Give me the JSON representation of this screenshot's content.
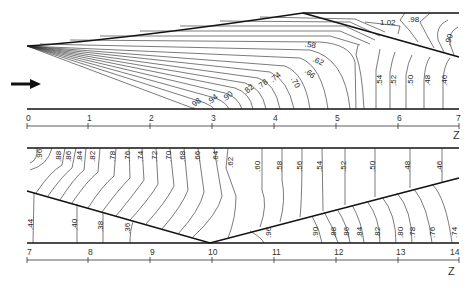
{
  "top_panel": {
    "axis_ticks": [
      "0",
      "1",
      "2",
      "3",
      "4",
      "5",
      "6",
      "7"
    ],
    "axis_label": "Z",
    "contour_labels": [
      ".98",
      ".94",
      ".90",
      ".82",
      ".78",
      ".74",
      ".70",
      ".66",
      ".62",
      ".58",
      ".54",
      ".52",
      ".50",
      ".48",
      ".46",
      "1.02",
      ".98",
      ".90"
    ],
    "flow_direction": "arrow-right"
  },
  "bottom_panel": {
    "axis_ticks": [
      "7",
      "8",
      "9",
      "10",
      "11",
      "12",
      "13",
      "14"
    ],
    "axis_label": "Z",
    "upper_labels": [
      ".96",
      ".88",
      ".86",
      ".84",
      ".82",
      ".78",
      ".76",
      ".74",
      ".72",
      ".70",
      ".68",
      ".66",
      ".64",
      ".62",
      ".60",
      ".58",
      ".56",
      ".54",
      ".52",
      ".50",
      ".48",
      ".46"
    ],
    "lower_left_labels": [
      ".44",
      ".40",
      ".38",
      ".36"
    ],
    "lower_right_labels": [
      ".96",
      ".90",
      ".88",
      ".86",
      ".84",
      ".82",
      ".80",
      ".78",
      ".76",
      ".74"
    ]
  }
}
